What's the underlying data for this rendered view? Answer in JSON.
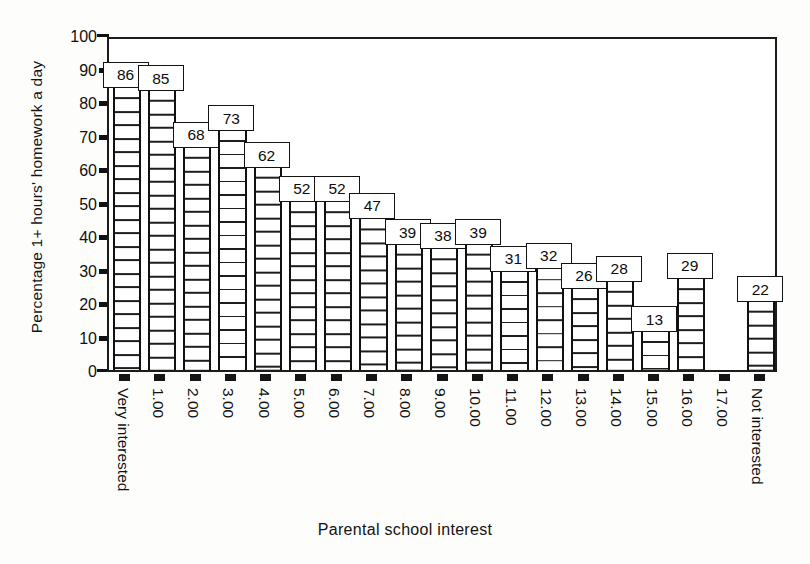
{
  "chart_data": {
    "type": "bar",
    "title": "",
    "xlabel": "Parental school interest",
    "ylabel": "Percentage 1+ hours' homework a day",
    "ylim": [
      0,
      100
    ],
    "ytick_labels": [
      "0",
      "10",
      "20",
      "30",
      "40",
      "50",
      "60",
      "70",
      "80",
      "90",
      "100"
    ],
    "ytick_values": [
      0,
      10,
      20,
      30,
      40,
      50,
      60,
      70,
      80,
      90,
      100
    ],
    "grid": false,
    "legend": "none",
    "categories": [
      "Very interested",
      "1.00",
      "2.00",
      "3.00",
      "4.00",
      "5.00",
      "6.00",
      "7.00",
      "8.00",
      "9.00",
      "10.00",
      "11.00",
      "12.00",
      "13.00",
      "14.00",
      "15.00",
      "16.00",
      "17.00",
      "Not interested"
    ],
    "values": [
      86,
      85,
      68,
      73,
      62,
      52,
      52,
      47,
      39,
      38,
      39,
      31,
      32,
      26,
      28,
      13,
      29,
      null,
      22
    ],
    "value_labels": [
      "86",
      "85",
      "68",
      "73",
      "62",
      "52",
      "52",
      "47",
      "39",
      "38",
      "39",
      "31",
      "32",
      "26",
      "28",
      "13",
      "29",
      "",
      "22"
    ]
  },
  "axis": {
    "y_title": "Percentage 1+ hours' homework a day",
    "x_title": "Parental school interest"
  }
}
